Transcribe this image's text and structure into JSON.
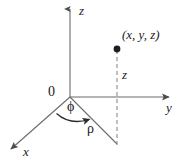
{
  "figure": {
    "background_color": "#ffffff",
    "line_color": "#555555",
    "text_color": "#1a1a1a"
  },
  "labels": {
    "z_axis": "z",
    "y_axis": "y",
    "x_axis": "x",
    "origin": "0",
    "point": "(x, y, z)",
    "z_height": "z",
    "phi": "ϕ",
    "rho": "ρ"
  },
  "geometry": {
    "origin": {
      "x": 70,
      "y": 97
    },
    "z_axis_tip": {
      "x": 70,
      "y": 5
    },
    "y_axis_tip": {
      "x": 173,
      "y": 97
    },
    "x_axis_tip": {
      "x": 7,
      "y": 152
    },
    "point_dot": {
      "x": 117,
      "y": 49
    },
    "foot_of_perpendicular": {
      "x": 117,
      "y": 144
    },
    "phi_arc_start": {
      "x": 57,
      "y": 114
    },
    "phi_arc_end": {
      "x": 93,
      "y": 120
    }
  }
}
